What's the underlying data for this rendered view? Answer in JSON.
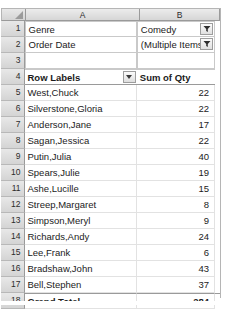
{
  "app": {
    "type": "spreadsheet",
    "select_all_icon": "select-all-triangle-icon"
  },
  "columns": {
    "headers": [
      "A",
      "B"
    ],
    "widths": [
      115,
      80
    ]
  },
  "row_numbers": [
    "1",
    "2",
    "3",
    "4",
    "5",
    "6",
    "7",
    "8",
    "9",
    "10",
    "11",
    "12",
    "13",
    "14",
    "15",
    "16",
    "17",
    "18"
  ],
  "filters": {
    "genre": {
      "label": "Genre",
      "value": "Comedy",
      "icon": "filter-funnel-icon"
    },
    "order_date": {
      "label": "Order Date",
      "value": "(Multiple Items)",
      "icon": "filter-funnel-icon"
    }
  },
  "pivot": {
    "row_labels_header": "Row Labels",
    "row_labels_dropdown_icon": "chevron-down-icon",
    "value_header": "Sum of Qty",
    "rows": [
      {
        "label": "West,Chuck",
        "value": "22"
      },
      {
        "label": "Silverstone,Gloria",
        "value": "22"
      },
      {
        "label": "Anderson,Jane",
        "value": "17"
      },
      {
        "label": "Sagan,Jessica",
        "value": "22"
      },
      {
        "label": "Putin,Julia",
        "value": "40"
      },
      {
        "label": "Spears,Julie",
        "value": "19"
      },
      {
        "label": "Ashe,Lucille",
        "value": "15"
      },
      {
        "label": "Streep,Margaret",
        "value": "8"
      },
      {
        "label": "Simpson,Meryl",
        "value": "9"
      },
      {
        "label": "Richards,Andy",
        "value": "24"
      },
      {
        "label": "Lee,Frank",
        "value": "6"
      },
      {
        "label": "Bradshaw,John",
        "value": "43"
      },
      {
        "label": "Bell,Stephen",
        "value": "37"
      }
    ],
    "grand_total": {
      "label": "Grand Total",
      "value": "284"
    }
  },
  "colors": {
    "header_band": "#dedede",
    "grid_line": "#e2e2e2",
    "border": "#9a9a9a",
    "text": "#1b1b1b"
  }
}
